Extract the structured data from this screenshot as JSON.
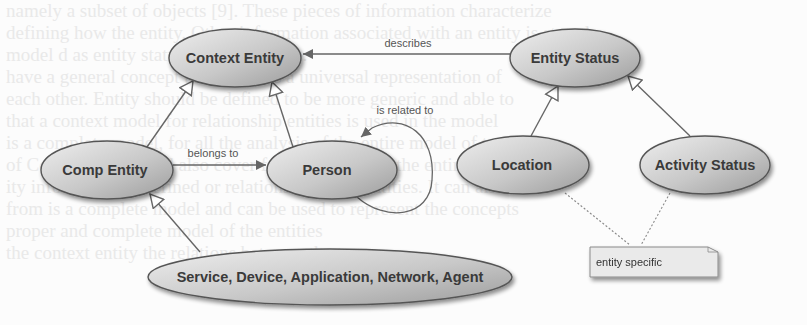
{
  "background_text": [
    "namely a subset of objects [9]. These pieces of information characterize",
    "defining how the entity. Other information associated with an entity is stored",
    "model d as entity status in a given time.",
    "have a general concept that entity as a universal representation of",
    "each other. Entity should be defined to be more generic and able to",
    "that a context model for relationship entities is used in the model",
    "is a complete model, for all the analysis of the entire model of type",
    "of Context Entity, and also cover for abstraction of the entire model.",
    "ity information is defined or relations between entities. It can also",
    "from is a complete model and can be used to represent the concepts",
    "proper and complete model of the entities",
    "the context entity the relations between the two"
  ],
  "colors": {
    "ellipse_fill_light": "#e8e8e8",
    "ellipse_fill_dark": "#a9a9a9",
    "ellipse_stroke": "#555555",
    "edge": "#666666",
    "note_fill": "#ececec",
    "note_stroke": "#8a8a8a"
  },
  "nodes": [
    {
      "id": "context_entity",
      "label": "Context Entity",
      "cx": 235,
      "cy": 58,
      "rx": 66,
      "ry": 29
    },
    {
      "id": "entity_status",
      "label": "Entity Status",
      "cx": 575,
      "cy": 58,
      "rx": 65,
      "ry": 29
    },
    {
      "id": "comp_entity",
      "label": "Comp Entity",
      "cx": 107,
      "cy": 170,
      "rx": 66,
      "ry": 29
    },
    {
      "id": "person",
      "label": "Person",
      "cx": 332,
      "cy": 170,
      "rx": 65,
      "ry": 29
    },
    {
      "id": "location",
      "label": "Location",
      "cx": 523,
      "cy": 165,
      "rx": 66,
      "ry": 29
    },
    {
      "id": "activity_status",
      "label": "Activity Status",
      "cx": 705,
      "cy": 165,
      "rx": 65,
      "ry": 29
    },
    {
      "id": "service_device",
      "label": "Service, Device, Application, Network, Agent",
      "cx": 330,
      "cy": 277,
      "rx": 182,
      "ry": 28
    }
  ],
  "edges": [
    {
      "from": "comp_entity",
      "to": "context_entity",
      "type": "generalization"
    },
    {
      "from": "person",
      "to": "context_entity",
      "type": "generalization"
    },
    {
      "from": "location",
      "to": "entity_status",
      "type": "generalization"
    },
    {
      "from": "activity_status",
      "to": "entity_status",
      "type": "generalization"
    },
    {
      "from": "service_device",
      "to": "comp_entity",
      "type": "generalization"
    },
    {
      "from": "entity_status",
      "to": "context_entity",
      "type": "association",
      "label": "describes"
    },
    {
      "from": "comp_entity",
      "to": "person",
      "type": "association",
      "label": "belongs to"
    },
    {
      "from": "person",
      "to": "person",
      "type": "self-association",
      "label": "is related to"
    }
  ],
  "note": {
    "label": "entity specific",
    "attached_to": [
      "location",
      "activity_status"
    ]
  }
}
